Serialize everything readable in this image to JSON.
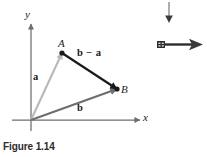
{
  "figure": {
    "caption": "Figure 1.14",
    "axes": {
      "x_label": "x",
      "y_label": "y",
      "origin_label": ""
    },
    "points": [
      {
        "name": "A",
        "label": "A",
        "x": 62,
        "y": 53
      },
      {
        "name": "B",
        "label": "B",
        "x": 117,
        "y": 89
      },
      {
        "name": "O",
        "label": "",
        "x": 31,
        "y": 120
      }
    ],
    "vectors": [
      {
        "name": "a",
        "label": "a",
        "from": "O",
        "to": "A",
        "color": "#b9b9b9",
        "style": "bold-italic-vector"
      },
      {
        "name": "b",
        "label": "b",
        "from": "O",
        "to": "B",
        "color": "#6e6e6e",
        "style": "bold-italic-vector"
      },
      {
        "name": "b-minus-a",
        "label": "b − a",
        "from": "A",
        "to": "B",
        "color": "#1a1a1a",
        "style": "bold-italic-vector"
      }
    ],
    "colors": {
      "axis": "#6e6e6e",
      "vector_a": "#b9b9b9",
      "vector_b": "#6e6e6e",
      "vector_b_minus_a": "#1a1a1a",
      "text": "#1a1a1a",
      "caption": "#2b2b2b",
      "background": "#ffffff"
    }
  },
  "cursor_marks": {
    "down_arrow_name": "down-arrow-icon",
    "right_arrow_name": "right-arrow-icon",
    "color": "#3a3a3a"
  }
}
